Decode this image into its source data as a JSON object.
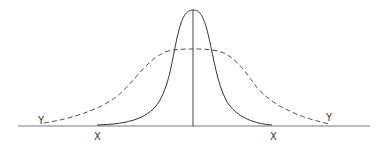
{
  "diagram": {
    "type": "distribution-comparison",
    "curves": [
      {
        "name": "narrow-distribution",
        "style": "solid",
        "color": "#333333"
      },
      {
        "name": "wide-distribution",
        "style": "dashed",
        "color": "#555555"
      }
    ],
    "labels": {
      "y_left": "Y",
      "x_left": "X",
      "x_right": "X",
      "y_right": "Y"
    },
    "colors": {
      "line": "#333333",
      "axis": "#777777",
      "background": "#ffffff"
    }
  }
}
